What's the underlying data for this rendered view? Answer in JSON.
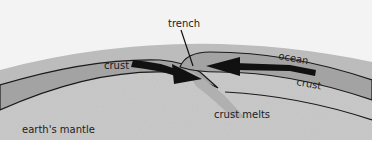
{
  "diagram": {
    "type": "subduction-zone cross-section",
    "labels": {
      "trench": "trench",
      "ocean": "ocean",
      "crust_left": "crust",
      "crust_right": "crust",
      "crust_melts": "crust melts",
      "mantle": "earth's mantle"
    },
    "arrows": [
      {
        "name": "left-plate-motion",
        "direction": "right"
      },
      {
        "name": "right-plate-motion",
        "direction": "left"
      }
    ],
    "colors": {
      "sky": "#f4f4f4",
      "ocean_band": "#bdbdbd",
      "crust_band": "#9a9a9a",
      "mantle": "#c8c8c8",
      "outline": "#1a1a1a",
      "arrow": "#111111",
      "bottom_border": "#ffffff"
    }
  }
}
